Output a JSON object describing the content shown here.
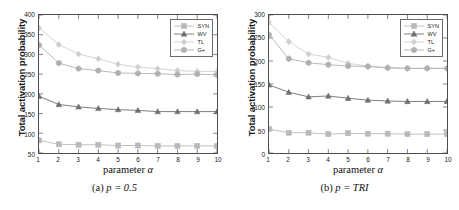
{
  "figure": {
    "ylabel": "Total activation probability",
    "xlabel_prefix": "parameter ",
    "xlabel_symbol": "α"
  },
  "panels": [
    {
      "id": "panel-a",
      "caption_index": "(a) ",
      "caption_body": "p = 0.5",
      "chart_data": {
        "type": "line",
        "title": "(a) p = 0.5",
        "xlabel": "parameter α",
        "ylabel": "Total activation probability",
        "x": [
          1,
          2,
          3,
          4,
          5,
          6,
          7,
          8,
          9,
          10
        ],
        "xlim": [
          1,
          10
        ],
        "ylim": [
          50,
          400
        ],
        "xticks": [
          1,
          2,
          3,
          4,
          5,
          6,
          7,
          8,
          9,
          10
        ],
        "yticks": [
          50,
          100,
          150,
          200,
          250,
          300,
          350,
          400
        ],
        "grid": false,
        "legend_position": "upper right",
        "series": [
          {
            "name": "SYN",
            "marker": "square",
            "color": "#b9b9b9",
            "values": [
              82,
              72,
              71,
              71,
              69,
              69,
              68,
              68,
              68,
              68
            ]
          },
          {
            "name": "WV",
            "marker": "triangle",
            "color": "#6f6f6f",
            "values": [
              194,
              173,
              167,
              163,
              160,
              158,
              155,
              155,
              155,
              155
            ]
          },
          {
            "name": "TL",
            "marker": "diamond",
            "color": "#cfcfcf",
            "values": [
              367,
              325,
              301,
              289,
              275,
              268,
              264,
              259,
              257,
              257
            ]
          },
          {
            "name": "G+",
            "marker": "hexagon",
            "color": "#b0b0b0",
            "values": [
              324,
              278,
              264,
              259,
              253,
              252,
              251,
              249,
              250,
              248
            ]
          }
        ]
      }
    },
    {
      "id": "panel-b",
      "caption_index": "(b) ",
      "caption_body": "p = TRI",
      "chart_data": {
        "type": "line",
        "title": "(b) p = TRI",
        "xlabel": "parameter α",
        "ylabel": "Total activation probability",
        "x": [
          1,
          2,
          3,
          4,
          5,
          6,
          7,
          8,
          9,
          10
        ],
        "xlim": [
          1,
          10
        ],
        "ylim": [
          0,
          300
        ],
        "xticks": [
          1,
          2,
          3,
          4,
          5,
          6,
          7,
          8,
          9,
          10
        ],
        "yticks": [
          0,
          50,
          100,
          150,
          200,
          250,
          300
        ],
        "grid": false,
        "legend_position": "upper right",
        "series": [
          {
            "name": "SYN",
            "marker": "square",
            "color": "#b9b9b9",
            "values": [
              52,
              44,
              44,
              41,
              43,
              42,
              42,
              41,
              41,
              41
            ]
          },
          {
            "name": "WV",
            "marker": "triangle",
            "color": "#6f6f6f",
            "values": [
              148,
              132,
              122,
              124,
              119,
              115,
              113,
              112,
              112,
              112
            ]
          },
          {
            "name": "TL",
            "marker": "diamond",
            "color": "#cfcfcf",
            "values": [
              284,
              242,
              215,
              208,
              195,
              189,
              186,
              184,
              184,
              184
            ]
          },
          {
            "name": "G+",
            "marker": "hexagon",
            "color": "#b0b0b0",
            "values": [
              257,
              205,
              196,
              192,
              189,
              188,
              185,
              184,
              184,
              184
            ]
          }
        ]
      }
    }
  ],
  "legend": {
    "items": [
      {
        "label": "SYN",
        "marker": "square",
        "color": "#b9b9b9"
      },
      {
        "label": "WV",
        "marker": "triangle",
        "color": "#6f6f6f"
      },
      {
        "label": "TL",
        "marker": "diamond",
        "color": "#cfcfcf"
      },
      {
        "label": "G+",
        "marker": "hexagon",
        "color": "#b0b0b0"
      }
    ]
  }
}
